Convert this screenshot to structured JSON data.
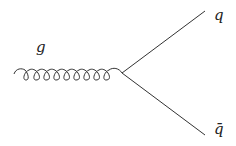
{
  "diagram": {
    "type": "feynman",
    "vertex": {
      "x": 122,
      "y": 73
    },
    "particles": {
      "gluon": {
        "label": "g",
        "loops": 9
      },
      "quark": {
        "label": "q"
      },
      "antiquark": {
        "label": "q̄"
      }
    },
    "line_color": "#333333"
  }
}
